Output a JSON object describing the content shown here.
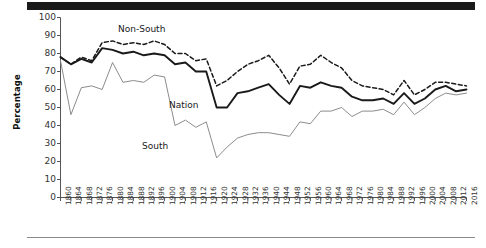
{
  "chart_data": {
    "type": "line",
    "title": "",
    "xlabel": "",
    "ylabel": "Percentage",
    "ylim": [
      0,
      100
    ],
    "ytick_values": [
      0,
      10,
      20,
      30,
      40,
      50,
      60,
      70,
      80,
      90,
      100
    ],
    "grid": false,
    "legend_position": "inline-annotations",
    "x": [
      1860,
      1864,
      1868,
      1872,
      1876,
      1880,
      1884,
      1888,
      1892,
      1896,
      1900,
      1904,
      1908,
      1912,
      1916,
      1920,
      1924,
      1928,
      1932,
      1936,
      1940,
      1944,
      1948,
      1952,
      1956,
      1960,
      1964,
      1968,
      1972,
      1976,
      1980,
      1984,
      1988,
      1992,
      1996,
      2000,
      2004,
      2008,
      2012,
      2016
    ],
    "xtick_labels": [
      "1860",
      "1864",
      "1868",
      "1872",
      "1876",
      "1880",
      "1884",
      "1888",
      "1892",
      "1896",
      "1900",
      "1904",
      "1908",
      "1912",
      "1916",
      "1920",
      "1924",
      "1928",
      "1932",
      "1936",
      "1940",
      "1944",
      "1948",
      "1952",
      "1956",
      "1960",
      "1964",
      "1968",
      "1972",
      "1976",
      "1980",
      "1984",
      "1988",
      "1992",
      "1996",
      "2000",
      "2004",
      "2008",
      "2012",
      "2016"
    ],
    "series": [
      {
        "name": "Non-South",
        "style": "dashed",
        "color": "#1a1a1a",
        "label_text": "Non-South",
        "values": [
          78,
          74,
          78,
          76,
          86,
          87,
          85,
          86,
          85,
          87,
          85,
          80,
          80,
          76,
          77,
          62,
          65,
          70,
          74,
          76,
          79,
          72,
          63,
          73,
          74,
          79,
          75,
          72,
          65,
          62,
          61,
          60,
          57,
          65,
          57,
          60,
          64,
          64,
          63,
          62
        ]
      },
      {
        "name": "Nation",
        "style": "solid",
        "color": "#1a1a1a",
        "label_text": "Nation",
        "values": [
          78,
          74,
          77,
          75,
          83,
          82,
          80,
          81,
          79,
          80,
          79,
          74,
          75,
          70,
          70,
          50,
          50,
          58,
          59,
          61,
          63,
          57,
          52,
          62,
          61,
          64,
          62,
          61,
          56,
          54,
          54,
          55,
          52,
          58,
          52,
          55,
          60,
          62,
          59,
          60
        ]
      },
      {
        "name": "South",
        "style": "solid-thin",
        "color": "#8c8c8c",
        "label_text": "South",
        "values": [
          76,
          46,
          61,
          62,
          60,
          75,
          64,
          65,
          64,
          68,
          67,
          40,
          43,
          39,
          42,
          22,
          28,
          33,
          35,
          36,
          36,
          35,
          34,
          42,
          41,
          48,
          48,
          50,
          45,
          48,
          48,
          49,
          46,
          53,
          46,
          50,
          55,
          58,
          57,
          58
        ]
      }
    ],
    "annotations": [
      {
        "text": "Non-South",
        "x_px": 118,
        "y_px": 24
      },
      {
        "text": "Nation",
        "x_px": 169,
        "y_px": 100
      },
      {
        "text": "South",
        "x_px": 142,
        "y_px": 141
      }
    ]
  },
  "figure": {
    "top_bar_color": "#1a1a1a",
    "bottom_rule_color": "#8a8a8a",
    "background": "#ffffff"
  }
}
